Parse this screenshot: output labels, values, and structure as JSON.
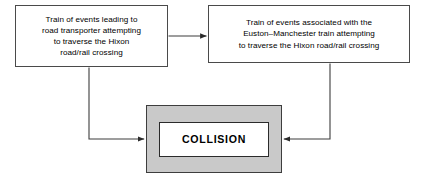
{
  "diagram": {
    "type": "flow-diagram",
    "background_color": "#ffffff",
    "nodes": [
      {
        "id": "road-transporter",
        "label": "Train of events leading to\nroad transporter attempting\nto traverse the Hixon\nroad/rail crossing",
        "fill_color": "#ffffff",
        "border_color": "#4a4a4a"
      },
      {
        "id": "euston-manchester",
        "label": "Train of events associated with the\nEuston–Manchester train attempting\nto traverse the Hixon road/rail crossing",
        "fill_color": "#ffffff",
        "border_color": "#4a4a4a"
      },
      {
        "id": "collision",
        "label": "COLLISION",
        "fill_color": "#c9c9c9",
        "inner_fill_color": "#ffffff",
        "border_color": "#3d3d3d"
      }
    ],
    "edges": [
      {
        "id": "road-transporter-to-euston-manchester",
        "from": "road-transporter",
        "to": "euston-manchester",
        "style": "straight-horizontal-arrow",
        "color": "#3d3d3d"
      },
      {
        "id": "road-transporter-to-collision",
        "from": "road-transporter",
        "to": "collision",
        "style": "elbow-down-right-arrow",
        "color": "#3d3d3d"
      },
      {
        "id": "euston-manchester-to-collision",
        "from": "euston-manchester",
        "to": "collision",
        "style": "elbow-down-left-arrow",
        "color": "#3d3d3d"
      }
    ]
  }
}
